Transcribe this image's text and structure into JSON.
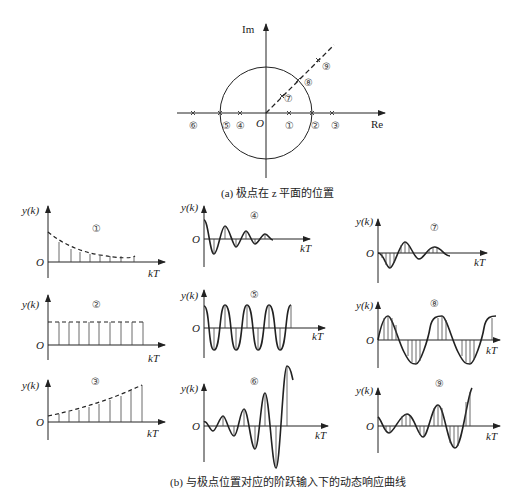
{
  "figure_a": {
    "caption": "(a) 极点在 z 平面的位置",
    "axis_im": "Im",
    "axis_re": "Re",
    "origin": "O",
    "pole_labels": [
      "⑥",
      "⑤",
      "④",
      "①",
      "②",
      "③",
      "⑦",
      "⑧",
      "⑨"
    ]
  },
  "figure_b": {
    "caption": "(b) 与极点位置对应的阶跃输入下的动态响应曲线",
    "y_label": "y(k)",
    "x_label": "kT",
    "origin": "O",
    "panels": [
      {
        "id": "①",
        "desc": "monotonic decaying"
      },
      {
        "id": "②",
        "desc": "constant amplitude"
      },
      {
        "id": "③",
        "desc": "monotonic diverging"
      },
      {
        "id": "④",
        "desc": "alternating decaying oscillation"
      },
      {
        "id": "⑤",
        "desc": "alternating constant oscillation"
      },
      {
        "id": "⑥",
        "desc": "alternating diverging oscillation"
      },
      {
        "id": "⑦",
        "desc": "damped oscillation"
      },
      {
        "id": "⑧",
        "desc": "sustained oscillation"
      },
      {
        "id": "⑨",
        "desc": "diverging oscillation"
      }
    ]
  }
}
